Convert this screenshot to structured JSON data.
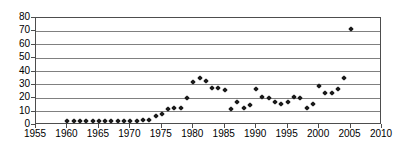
{
  "chart_data": {
    "type": "scatter",
    "title": "",
    "subtitle": "",
    "xlabel": "",
    "ylabel": "",
    "xlim": [
      1955,
      2010
    ],
    "ylim": [
      0,
      80
    ],
    "xticks": [
      1955,
      1960,
      1965,
      1970,
      1975,
      1980,
      1985,
      1990,
      1995,
      2000,
      2005,
      2010
    ],
    "yticks": [
      0,
      10,
      20,
      30,
      40,
      50,
      60,
      70,
      80
    ],
    "xtick_labels": [
      "1955",
      "1960",
      "1965",
      "1970",
      "1975",
      "1980",
      "1985",
      "1990",
      "1995",
      "2000",
      "2005",
      "2010"
    ],
    "ytick_labels": [
      "0",
      "10",
      "20",
      "30",
      "40",
      "50",
      "60",
      "70",
      "80"
    ],
    "grid": "horizontal",
    "legend": "none",
    "marker": "diamond",
    "marker_color": "#1a1a1a",
    "series": [
      {
        "name": "series-1",
        "x": [
          1960,
          1961,
          1962,
          1963,
          1964,
          1965,
          1966,
          1967,
          1968,
          1969,
          1970,
          1971,
          1972,
          1973,
          1974,
          1975,
          1976,
          1977,
          1978,
          1979,
          1980,
          1981,
          1982,
          1983,
          1984,
          1985,
          1986,
          1987,
          1988,
          1989,
          1990,
          1991,
          1992,
          1993,
          1994,
          1995,
          1996,
          1997,
          1998,
          1999,
          2000,
          2001,
          2002,
          2003,
          2004,
          2005
        ],
        "y": [
          3,
          3,
          3,
          3,
          3,
          3,
          3,
          3,
          3,
          3,
          3,
          3,
          4,
          4,
          7,
          8,
          12,
          13,
          13,
          20,
          32,
          35,
          33,
          28,
          28,
          26,
          12,
          17,
          13,
          15,
          27,
          21,
          20,
          17,
          16,
          17,
          21,
          20,
          13,
          16,
          29,
          24,
          24,
          27,
          35,
          72
        ]
      }
    ]
  }
}
